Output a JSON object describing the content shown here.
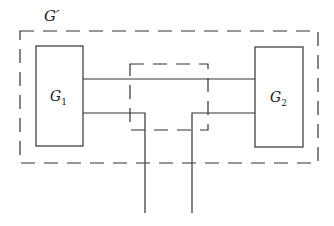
{
  "diagram": {
    "outer_label": "G′",
    "left_block": {
      "label": "G",
      "sub": "1"
    },
    "right_block": {
      "label": "G",
      "sub": "2"
    },
    "stroke_color": "#333333"
  }
}
